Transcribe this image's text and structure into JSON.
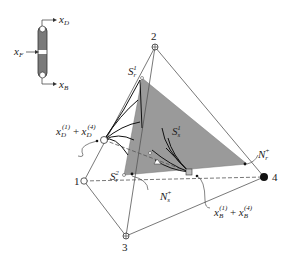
{
  "column": {
    "feed_label": "x",
    "feed_sub": "F",
    "top_label": "x",
    "top_sub": "D",
    "bottom_label": "x",
    "bottom_sub": "B"
  },
  "vertices": {
    "v1": "1",
    "v2": "2",
    "v3": "3",
    "v4": "4"
  },
  "labels": {
    "sr1": {
      "base": "S",
      "sub": "r",
      "sup": "1"
    },
    "sr2": {
      "base": "S",
      "sub": "r",
      "sup": "2"
    },
    "ss1": {
      "base": "S",
      "sub": "s",
      "sup": "1"
    },
    "nr": {
      "base": "N",
      "sub": "r",
      "sup": "+"
    },
    "ns": {
      "base": "N",
      "sub": "s",
      "sup": "+"
    },
    "xd": {
      "base1": "x",
      "sub1": "D",
      "sup1": "(1)",
      "op": "+",
      "base2": "x",
      "sub2": "D",
      "sup2": "(4)"
    },
    "xb": {
      "base1": "x",
      "sub1": "B",
      "sup1": "(1)",
      "op": "+",
      "base2": "x",
      "sub2": "B",
      "sup2": "(4)"
    }
  },
  "colors": {
    "line": "#555555",
    "shade": "#9a9a9a",
    "dark": "#111111",
    "column_fill": "#7a7a7a"
  }
}
